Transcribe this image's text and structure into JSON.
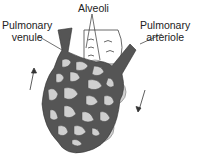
{
  "labels": {
    "alveoli": "Alveoli",
    "venule_line1": "Pulmonary",
    "venule_line2": "venule",
    "arteriole_line1": "Pulmonary",
    "arteriole_line2": "arteriole"
  },
  "colors": {
    "vessel": "#555555",
    "alveolus": "#cfcfcf",
    "outline": "#333333"
  },
  "flow": {
    "left_arrow": "up",
    "right_arrow": "down"
  }
}
